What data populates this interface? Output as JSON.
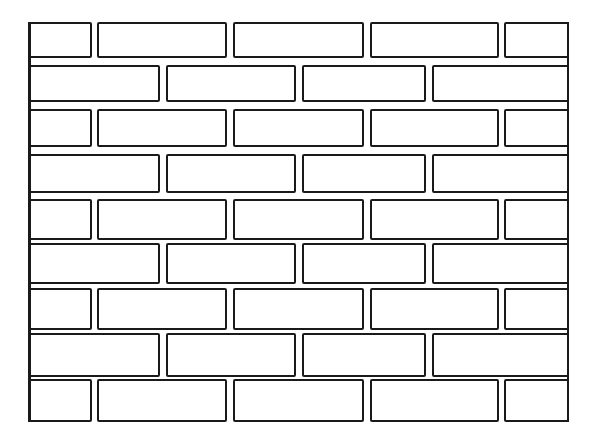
{
  "diagram": {
    "title": "",
    "colors": {
      "line": "#1a1a1a",
      "background": "#ffffff",
      "brick_fill": "#ffffff"
    },
    "wall": {
      "left": 28,
      "top": 22,
      "right": 569,
      "bottom": 422
    },
    "row_count": 9,
    "row_tops": [
      22,
      65,
      109,
      154,
      199,
      243,
      288,
      333,
      379
    ],
    "row_bottoms": [
      58,
      102,
      147,
      193,
      240,
      284,
      330,
      377,
      422
    ],
    "patterns": {
      "odd": [
        [
          28,
          92
        ],
        [
          97,
          227
        ],
        [
          233,
          364
        ],
        [
          370,
          499
        ],
        [
          504,
          569
        ]
      ],
      "even": [
        [
          28,
          160
        ],
        [
          166,
          296
        ],
        [
          302,
          426
        ],
        [
          432,
          569
        ]
      ]
    },
    "rows": [
      "odd",
      "even",
      "odd",
      "even",
      "odd",
      "even",
      "odd",
      "even",
      "odd"
    ]
  }
}
